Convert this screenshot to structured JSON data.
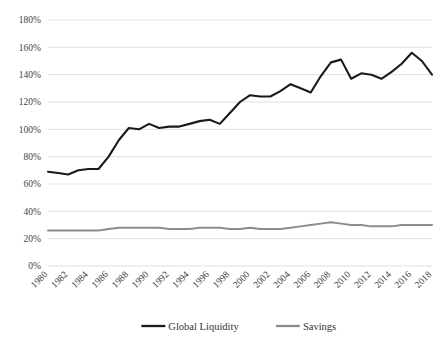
{
  "chart_data": {
    "type": "line",
    "title": "",
    "xlabel": "",
    "ylabel": "",
    "ylim": [
      0,
      180
    ],
    "ytick_values": [
      0,
      20,
      40,
      60,
      80,
      100,
      120,
      140,
      160,
      180
    ],
    "ytick_labels": [
      "0%",
      "20%",
      "40%",
      "60%",
      "80%",
      "100%",
      "120%",
      "140%",
      "160%",
      "180%"
    ],
    "xlim": [
      1980,
      2019
    ],
    "xtick_labels": [
      "1980",
      "1982",
      "1984",
      "1986",
      "1988",
      "1990",
      "1992",
      "1994",
      "1996",
      "1998",
      "2000",
      "2002",
      "2004",
      "2006",
      "2008",
      "2010",
      "2012",
      "2014",
      "2016",
      "2018"
    ],
    "grid": "horizontal",
    "legend_position": "bottom-center",
    "x": [
      1980,
      1981,
      1982,
      1983,
      1984,
      1985,
      1986,
      1987,
      1988,
      1989,
      1990,
      1991,
      1992,
      1993,
      1994,
      1995,
      1996,
      1997,
      1998,
      1999,
      2000,
      2001,
      2002,
      2003,
      2004,
      2005,
      2006,
      2007,
      2008,
      2009,
      2010,
      2011,
      2012,
      2013,
      2014,
      2015,
      2016,
      2017,
      2018
    ],
    "series": [
      {
        "name": "Global Liquidity",
        "color": "#1a1a1a",
        "values": [
          69,
          68,
          67,
          70,
          71,
          71,
          80,
          92,
          101,
          100,
          104,
          101,
          102,
          102,
          104,
          106,
          107,
          104,
          112,
          120,
          125,
          124,
          124,
          128,
          133,
          130,
          127,
          139,
          149,
          151,
          137,
          141,
          140,
          137,
          142,
          148,
          156,
          150,
          140
        ]
      },
      {
        "name": "Savings",
        "color": "#8c8c8c",
        "values": [
          26,
          26,
          26,
          26,
          26,
          26,
          27,
          28,
          28,
          28,
          28,
          28,
          27,
          27,
          27,
          28,
          28,
          28,
          27,
          27,
          28,
          27,
          27,
          27,
          28,
          29,
          30,
          31,
          32,
          31,
          30,
          30,
          29,
          29,
          29,
          30,
          30,
          30,
          30
        ]
      }
    ]
  },
  "legend": {
    "items": [
      {
        "label": "Global Liquidity"
      },
      {
        "label": "Savings"
      }
    ]
  }
}
